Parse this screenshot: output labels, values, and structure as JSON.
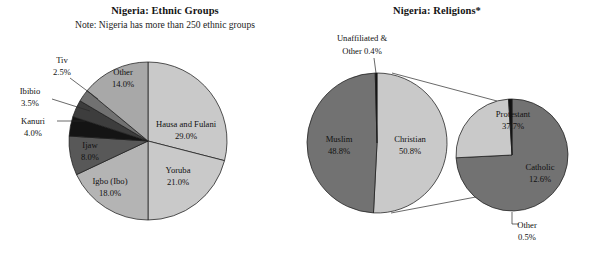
{
  "figure": {
    "width": 593,
    "height": 260,
    "background": "#ffffff"
  },
  "charts": [
    {
      "id": "ethnic-groups",
      "title": "Nigeria: Ethnic Groups",
      "subtitle": "Note: Nigeria has more than 250 ethnic groups",
      "title_x": 165,
      "title_y": 14,
      "subtitle_x": 165,
      "subtitle_y": 28,
      "center": {
        "x": 148,
        "y": 141
      },
      "radius": 79,
      "start_angle_deg": 0,
      "direction": "clockwise"
    },
    {
      "id": "religions",
      "title": "Nigeria: Religions*",
      "subtitle": "",
      "title_x": 437,
      "title_y": 14,
      "center": {
        "x": 377,
        "y": 143
      },
      "radius": 70,
      "start_angle_deg": 0,
      "direction": "clockwise"
    },
    {
      "id": "christian-breakdown",
      "title": "",
      "subtitle": "",
      "center": {
        "x": 512,
        "y": 155
      },
      "radius": 56,
      "start_angle_deg": 0,
      "direction": "clockwise"
    }
  ],
  "chart_data": [
    {
      "type": "pie",
      "id": "ethnic-groups",
      "title": "Nigeria: Ethnic Groups",
      "subtitle": "Note: Nigeria has more than 250 ethnic groups",
      "xlabel": "",
      "ylabel": "",
      "legend": "none",
      "units": "percent",
      "categories": [
        "Hausa and Fulani",
        "Yoruba",
        "Igbo (Ibo)",
        "Ijaw",
        "Kanuri",
        "Ibibio",
        "Tiv",
        "Other"
      ],
      "values": [
        29.0,
        21.0,
        18.0,
        8.0,
        4.0,
        3.5,
        2.5,
        14.0
      ],
      "slices": [
        {
          "name": "Hausa and Fulani",
          "value": 29.0,
          "label": "Hausa and Fulani",
          "percent_label": "29.0%",
          "color": "#c9c9c9",
          "label_placement": "inside",
          "label_x": 186,
          "label_y": 127,
          "label_x2": 186,
          "label_y2": 139
        },
        {
          "name": "Yoruba",
          "value": 21.0,
          "label": "Yoruba",
          "percent_label": "21.0%",
          "color": "#c9c9c9",
          "label_placement": "inside",
          "label_x": 178,
          "label_y": 173,
          "label_x2": 178,
          "label_y2": 185
        },
        {
          "name": "Igbo (Ibo)",
          "value": 18.0,
          "label": "Igbo (Ibo)",
          "percent_label": "18.0%",
          "color": "#b4b4b4",
          "label_placement": "inside",
          "label_x": 110,
          "label_y": 184,
          "label_x2": 110,
          "label_y2": 196
        },
        {
          "name": "Ijaw",
          "value": 8.0,
          "label": "Ijaw",
          "percent_label": "8.0%",
          "color": "#585858",
          "label_placement": "inside",
          "label_x": 90,
          "label_y": 148,
          "label_x2": 90,
          "label_y2": 160
        },
        {
          "name": "Kanuri",
          "value": 4.0,
          "label": "Kanuri",
          "percent_label": "4.0%",
          "color": "#141414",
          "label_placement": "outside",
          "label_x": 33,
          "label_y": 124,
          "label_x2": 33,
          "label_y2": 136,
          "leader": "M 57 121 L 85 121"
        },
        {
          "name": "Ibibio",
          "value": 3.5,
          "label": "Ibibio",
          "percent_label": "3.5%",
          "color": "#3d3d3d",
          "label_placement": "outside",
          "label_x": 30,
          "label_y": 94,
          "label_x2": 30,
          "label_y2": 106,
          "leader": "M 52 99 L 90 111"
        },
        {
          "name": "Tiv",
          "value": 2.5,
          "label": "Tiv",
          "percent_label": "2.5%",
          "color": "#717171",
          "label_placement": "outside",
          "label_x": 62,
          "label_y": 63,
          "label_x2": 62,
          "label_y2": 75,
          "leader": "M 70 78 L 98 99"
        },
        {
          "name": "Other",
          "value": 14.0,
          "label": "Other",
          "percent_label": "14.0%",
          "color": "#a8a8a8",
          "label_placement": "inside",
          "label_x": 123,
          "label_y": 75,
          "label_x2": 123,
          "label_y2": 87
        }
      ]
    },
    {
      "type": "pie",
      "id": "religions",
      "title": "Nigeria: Religions*",
      "subtitle": "",
      "xlabel": "",
      "ylabel": "",
      "legend": "none",
      "units": "percent",
      "categories": [
        "Christian",
        "Muslim",
        "Unaffiliated & Other"
      ],
      "values": [
        50.8,
        48.8,
        0.4
      ],
      "slices": [
        {
          "name": "Christian",
          "value": 50.8,
          "label": "Christian",
          "percent_label": "50.8%",
          "color": "#c9c9c9",
          "label_placement": "inside",
          "label_x": 410,
          "label_y": 142,
          "label_x2": 410,
          "label_y2": 154
        },
        {
          "name": "Muslim",
          "value": 48.8,
          "label": "Muslim",
          "percent_label": "48.8%",
          "color": "#727272",
          "label_placement": "inside",
          "label_x": 339,
          "label_y": 142,
          "label_x2": 339,
          "label_y2": 154
        },
        {
          "name": "Unaffiliated & Other",
          "value": 0.4,
          "label": "Unaffiliated &",
          "percent_label": "Other 0.4%",
          "color": "#111111",
          "label_placement": "outside",
          "label_x": 362,
          "label_y": 41,
          "label_x2": 362,
          "label_y2": 54,
          "leader": "M 374 58 L 376 73"
        }
      ]
    },
    {
      "type": "pie",
      "id": "christian-breakdown",
      "title": "",
      "subtitle": "",
      "xlabel": "",
      "ylabel": "",
      "legend": "none",
      "units": "percent",
      "note": "Exploded breakdown of the Christian slice",
      "categories": [
        "Protestant",
        "Catholic",
        "Other"
      ],
      "values": [
        37.7,
        12.6,
        0.5
      ],
      "slices": [
        {
          "name": "Protestant",
          "value": 37.7,
          "label": "Protestant",
          "percent_label": "37.7%",
          "color": "#727272",
          "label_placement": "inside",
          "label_x": 513,
          "label_y": 117,
          "label_x2": 513,
          "label_y2": 129
        },
        {
          "name": "Catholic",
          "value": 12.6,
          "label": "Catholic",
          "percent_label": "12.6%",
          "color": "#c9c9c9",
          "label_placement": "inside",
          "label_x": 540,
          "label_y": 170,
          "label_x2": 540,
          "label_y2": 182
        },
        {
          "name": "Other",
          "value": 0.5,
          "label": "Other",
          "percent_label": "0.5%",
          "color": "#111111",
          "label_placement": "outside",
          "label_x": 527,
          "label_y": 228,
          "label_x2": 527,
          "label_y2": 240,
          "leader": "M 512 212 L 512 224 L 519 224"
        }
      ]
    }
  ],
  "connectors": {
    "explosion_upper": "M 392 73 L 497 101",
    "explosion_lower": "M 391 213 L 497 193",
    "catholic_box": "M 496 146 L 570 146 L 570 205 L 496 205 Z"
  }
}
